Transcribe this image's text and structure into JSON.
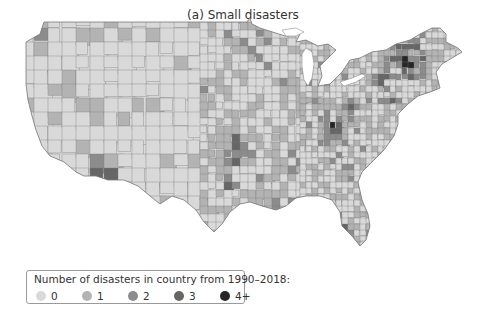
{
  "title": "(a) Small disasters",
  "legend": {
    "title": "Number of disasters in country from 1990–2018:",
    "items": [
      {
        "label": "0",
        "color": "#d9d9d9"
      },
      {
        "label": "1",
        "color": "#b3b3b3"
      },
      {
        "label": "2",
        "color": "#8c8c8c"
      },
      {
        "label": "3",
        "color": "#666666"
      },
      {
        "label": "4+",
        "color": "#262626"
      }
    ]
  },
  "map": {
    "region": "Contiguous United States",
    "unit": "county",
    "border_color": "#6e6e6e",
    "high_concentration_areas": [
      "Pacific Northwest (western Washington)",
      "Southern California",
      "Southern Arizona",
      "Oklahoma / Texas",
      "Kentucky / West Virginia",
      "Northern New York / New England"
    ]
  }
}
